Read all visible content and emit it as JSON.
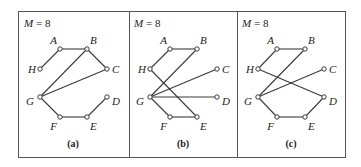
{
  "figure": {
    "panels": [
      {
        "id": "a",
        "title": "M = 8",
        "caption": "(a)",
        "offset_x": 0,
        "nodes": {
          "A": [
            60,
            49
          ],
          "B": [
            87,
            49
          ],
          "H": [
            40,
            69
          ],
          "C": [
            107,
            69
          ],
          "G": [
            40,
            97
          ],
          "D": [
            107,
            97
          ],
          "F": [
            60,
            117
          ],
          "E": [
            87,
            117
          ]
        },
        "edges": [
          [
            "H",
            "A"
          ],
          [
            "A",
            "B"
          ],
          [
            "B",
            "C"
          ],
          [
            "B",
            "G"
          ],
          [
            "C",
            "G"
          ],
          [
            "G",
            "F"
          ],
          [
            "F",
            "E"
          ],
          [
            "E",
            "D"
          ]
        ]
      },
      {
        "id": "b",
        "title": "M = 8",
        "caption": "(b)",
        "offset_x": 110,
        "nodes": {
          "A": [
            170,
            49
          ],
          "B": [
            197,
            49
          ],
          "H": [
            150,
            69
          ],
          "C": [
            217,
            69
          ],
          "G": [
            150,
            97
          ],
          "D": [
            217,
            97
          ],
          "F": [
            170,
            117
          ],
          "E": [
            197,
            117
          ]
        },
        "edges": [
          [
            "H",
            "A"
          ],
          [
            "A",
            "B"
          ],
          [
            "H",
            "E"
          ],
          [
            "G",
            "B"
          ],
          [
            "G",
            "C"
          ],
          [
            "G",
            "D"
          ],
          [
            "G",
            "F"
          ],
          [
            "F",
            "E"
          ]
        ]
      },
      {
        "id": "c",
        "title": "M = 8",
        "caption": "(c)",
        "offset_x": 218,
        "nodes": {
          "A": [
            277,
            49
          ],
          "B": [
            305,
            49
          ],
          "H": [
            258,
            69
          ],
          "C": [
            324,
            69
          ],
          "G": [
            258,
            97
          ],
          "D": [
            324,
            97
          ],
          "F": [
            277,
            117
          ],
          "E": [
            305,
            117
          ]
        },
        "edges": [
          [
            "H",
            "A"
          ],
          [
            "A",
            "B"
          ],
          [
            "H",
            "D"
          ],
          [
            "G",
            "B"
          ],
          [
            "G",
            "C"
          ],
          [
            "G",
            "F"
          ],
          [
            "F",
            "E"
          ],
          [
            "E",
            "D"
          ]
        ]
      }
    ],
    "label_offsets": {
      "A": [
        -3,
        -5,
        "end"
      ],
      "B": [
        3,
        -5,
        "start"
      ],
      "H": [
        -4,
        4,
        "end"
      ],
      "C": [
        5,
        4,
        "start"
      ],
      "G": [
        -6,
        8,
        "end"
      ],
      "D": [
        5,
        8,
        "start"
      ],
      "F": [
        -3,
        13,
        "end"
      ],
      "E": [
        3,
        13,
        "start"
      ]
    },
    "frame": {
      "left": 18,
      "top": 11,
      "right": 345,
      "bottom": 157,
      "dividers": [
        129,
        237
      ]
    }
  }
}
